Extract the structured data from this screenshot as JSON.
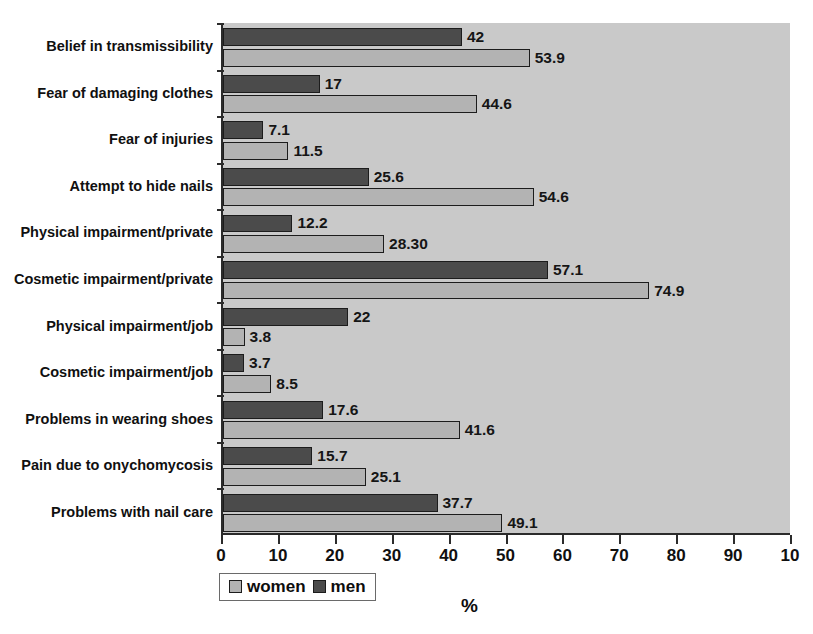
{
  "chart_data": {
    "type": "bar",
    "orientation": "horizontal",
    "title": "",
    "xlabel": "%",
    "ylabel": "",
    "xlim": [
      0,
      100
    ],
    "xticks": [
      0,
      10,
      20,
      30,
      40,
      50,
      60,
      70,
      80,
      90,
      100
    ],
    "xtick_labels": [
      "0",
      "10",
      "20",
      "30",
      "40",
      "50",
      "60",
      "70",
      "80",
      "90",
      "10"
    ],
    "grid": false,
    "legend_position": "bottom-left",
    "categories": [
      "Belief in transmissibility",
      "Fear of damaging clothes",
      "Fear of injuries",
      "Attempt to hide nails",
      "Physical impairment/private",
      "Cosmetic impairment/private",
      "Physical impairment/job",
      "Cosmetic impairment/job",
      "Problems in wearing shoes",
      "Pain due to onychomycosis",
      "Problems with nail care"
    ],
    "series": [
      {
        "name": "women",
        "color": "#b3b3b3",
        "values": [
          53.9,
          44.6,
          11.5,
          54.6,
          28.3,
          74.9,
          3.8,
          8.5,
          41.6,
          25.1,
          49.1
        ],
        "value_labels": [
          "53.9",
          "44.6",
          "11.5",
          "54.6",
          "28.30",
          "74.9",
          "3.8",
          "8.5",
          "41.6",
          "25.1",
          "49.1"
        ]
      },
      {
        "name": "men",
        "color": "#4b4b4b",
        "values": [
          42,
          17,
          7.1,
          25.6,
          12.2,
          57.1,
          22,
          3.7,
          17.6,
          15.7,
          37.7
        ],
        "value_labels": [
          "42",
          "17",
          "7.1",
          "25.6",
          "12.2",
          "57.1",
          "22",
          "3.7",
          "17.6",
          "15.7",
          "37.7"
        ]
      }
    ]
  },
  "legend": {
    "items": [
      {
        "label": "women",
        "swatch": "legend-swatch-women"
      },
      {
        "label": "men",
        "swatch": "legend-swatch-men"
      }
    ]
  },
  "axis": {
    "x_title": "%"
  }
}
